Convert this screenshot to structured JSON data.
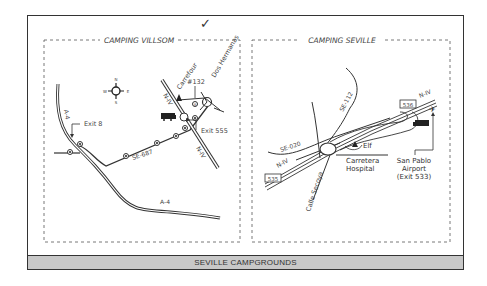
{
  "caption": "SEVILLE CAMPGROUNDS",
  "checkmark": "✓",
  "panels": [
    {
      "title": "CAMPING VILLSOM",
      "compass": {
        "n": "N",
        "s": "S",
        "e": "E",
        "w": "W"
      },
      "labels": {
        "road_a4_north": "A-4",
        "road_a4_south": "A-4",
        "road_se687": "SE-687",
        "road_nv_north": "N-IV",
        "road_nv_south": "N-IV",
        "exit_8": "Exit 8",
        "exit_555": "Exit 555",
        "carrefour": "Carrefour",
        "number_132": "#132",
        "dos_hermanas": "Dos Hermanas"
      }
    },
    {
      "title": "CAMPING SEVILLE",
      "labels": {
        "road_se020": "SE-020",
        "road_se112": "SE-112",
        "road_nv_east": "N-IV",
        "road_nv_west": "N-IV",
        "exit_box_east": "536",
        "exit_box_west": "535",
        "elf": "Elf",
        "carretera_line1": "Carretera",
        "carretera_line2": "Hospital",
        "calle_secoya": "Calle Secoya",
        "airport_line1": "San Pablo",
        "airport_line2": "Airport",
        "airport_line3": "(Exit 533)"
      }
    }
  ],
  "icons": [
    "compass-rose-icon",
    "campground-rv-icon",
    "shop-triangle-icon",
    "airport-plane-icon",
    "checkmark-icon"
  ]
}
